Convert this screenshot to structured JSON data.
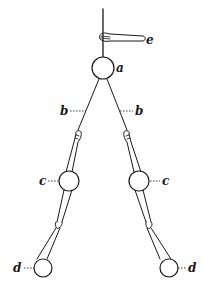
{
  "diagram": {
    "labels": {
      "a": "a",
      "b_left": "b",
      "b_right": "b",
      "c_left": "c",
      "c_right": "c",
      "d_left": "d",
      "d_right": "d",
      "e": "e"
    },
    "colors": {
      "ink": "#1a1a1a",
      "background": "#ffffff"
    }
  }
}
